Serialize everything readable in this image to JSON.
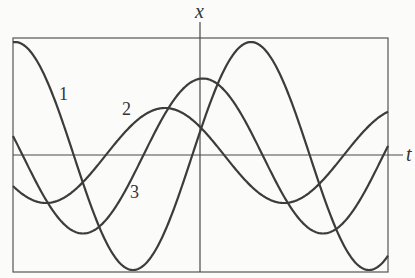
{
  "chart_data": {
    "type": "line",
    "title": "",
    "xlabel": "t",
    "ylabel": "x",
    "grid": false,
    "legend": "inline labels",
    "frame": {
      "left": 13,
      "top": 38,
      "right": 388,
      "bottom": 272
    },
    "axes": {
      "origin_px": [
        200,
        155
      ],
      "t_axis_end_px": 403,
      "x_axis_top_px": 22
    },
    "series": [
      {
        "name": "1",
        "label_pos_px": [
          63,
          98
        ],
        "amplitude_px": 114,
        "center_px": 156,
        "period_px": 236,
        "peak_t_px": 15
      },
      {
        "name": "2",
        "label_pos_px": [
          130,
          113
        ],
        "amplitude_px": 47.5,
        "center_px": 155.5,
        "period_px": 238,
        "peak_t_px": 165
      },
      {
        "name": "3",
        "label_pos_px": [
          135,
          196
        ],
        "amplitude_px": 77.5,
        "center_px": 156,
        "period_px": 240,
        "peak_t_px": 203
      }
    ]
  },
  "labels": {
    "x_axis": "x",
    "t_axis": "t",
    "curve1": "1",
    "curve2": "2",
    "curve3": "3"
  },
  "colors": {
    "curve": "#3c3c3c",
    "axis": "#4a4a4a",
    "frame": "#555555",
    "background": "#fbfbfa"
  }
}
